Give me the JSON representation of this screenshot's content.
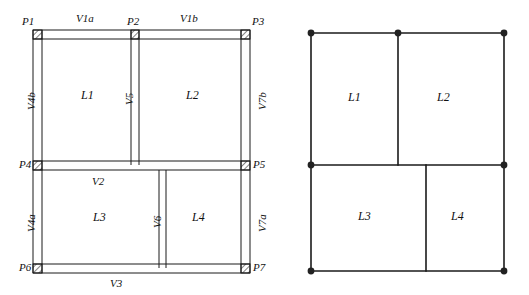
{
  "figure": {
    "stroke_color": "#1a1a1a",
    "node_color": "#222222",
    "background": "#ffffff"
  },
  "detailed_plan": {
    "name": "detailed-wall-plan",
    "joints": [
      {
        "id": "P1",
        "label": "P1",
        "x": 40,
        "y": 30
      },
      {
        "id": "P2",
        "label": "P2",
        "x": 136,
        "y": 30
      },
      {
        "id": "P3",
        "label": "P3",
        "x": 243,
        "y": 30
      },
      {
        "id": "P4",
        "label": "P4",
        "x": 40,
        "y": 163
      },
      {
        "id": "P5",
        "label": "P5",
        "x": 243,
        "y": 163
      },
      {
        "id": "P6",
        "label": "P6",
        "x": 40,
        "y": 270
      },
      {
        "id": "P7",
        "label": "P7",
        "x": 243,
        "y": 270
      }
    ],
    "walls": [
      {
        "id": "V1a",
        "label": "V1a",
        "orientation": "horizontal",
        "span": "P1-P2"
      },
      {
        "id": "V1b",
        "label": "V1b",
        "orientation": "horizontal",
        "span": "P2-P3"
      },
      {
        "id": "V2",
        "label": "V2",
        "orientation": "horizontal",
        "span": "P4-P5"
      },
      {
        "id": "V3",
        "label": "V3",
        "orientation": "horizontal",
        "span": "P6-P7"
      },
      {
        "id": "V4b",
        "label": "V4b",
        "orientation": "vertical",
        "span": "P1-P4"
      },
      {
        "id": "V4a",
        "label": "V4a",
        "orientation": "vertical",
        "span": "P4-P6"
      },
      {
        "id": "V5",
        "label": "V5",
        "orientation": "vertical",
        "span": "P2-P4"
      },
      {
        "id": "V6",
        "label": "V6",
        "orientation": "vertical",
        "span": "interior-lower"
      },
      {
        "id": "V7b",
        "label": "V7b",
        "orientation": "vertical",
        "span": "P3-P5"
      },
      {
        "id": "V7a",
        "label": "V7a",
        "orientation": "vertical",
        "span": "P5-P7"
      }
    ],
    "rooms": [
      {
        "id": "L1",
        "label": "L1",
        "x": 88,
        "y": 95
      },
      {
        "id": "L2",
        "label": "L2",
        "x": 193,
        "y": 95
      },
      {
        "id": "L3",
        "label": "L3",
        "x": 100,
        "y": 217
      },
      {
        "id": "L4",
        "label": "L4",
        "x": 199,
        "y": 217
      }
    ]
  },
  "simplified_model": {
    "name": "simplified-line-model",
    "rooms": [
      {
        "id": "L1",
        "label": "L1",
        "x": 358,
        "y": 97
      },
      {
        "id": "L2",
        "label": "L2",
        "x": 447,
        "y": 97
      },
      {
        "id": "L3",
        "label": "L3",
        "x": 368,
        "y": 216
      },
      {
        "id": "L4",
        "label": "L4",
        "x": 461,
        "y": 216
      }
    ],
    "nodes": [
      {
        "id": "n1",
        "x": 311,
        "y": 33
      },
      {
        "id": "n2",
        "x": 398,
        "y": 33
      },
      {
        "id": "n3",
        "x": 504,
        "y": 33
      },
      {
        "id": "n4",
        "x": 311,
        "y": 165
      },
      {
        "id": "n5",
        "x": 504,
        "y": 165
      },
      {
        "id": "n6",
        "x": 311,
        "y": 271
      },
      {
        "id": "n7",
        "x": 504,
        "y": 271
      }
    ]
  }
}
